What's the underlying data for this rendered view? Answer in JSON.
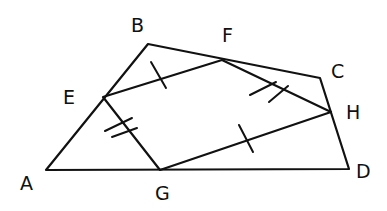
{
  "diagram": {
    "stroke_color": "#111111",
    "background": "#ffffff",
    "labels": {
      "A": "A",
      "B": "B",
      "C": "C",
      "D": "D",
      "E": "E",
      "F": "F",
      "G": "G",
      "H": "H"
    },
    "vertices": {
      "A": [
        46,
        170
      ],
      "B": [
        148,
        44
      ],
      "C": [
        320,
        78
      ],
      "D": [
        349,
        169
      ],
      "E": [
        103,
        97
      ],
      "F": [
        222,
        60
      ],
      "G": [
        160,
        170
      ],
      "H": [
        331,
        112
      ]
    },
    "outer_quadrilateral": [
      "A",
      "B",
      "C",
      "D"
    ],
    "inner_quadrilateral": [
      "E",
      "F",
      "H",
      "G"
    ],
    "congruence_marks": [
      {
        "segment": "EF",
        "ticks": 1
      },
      {
        "segment": "GH",
        "ticks": 1
      },
      {
        "segment": "FH",
        "ticks": 2
      },
      {
        "segment": "EG",
        "ticks": 2
      }
    ]
  }
}
